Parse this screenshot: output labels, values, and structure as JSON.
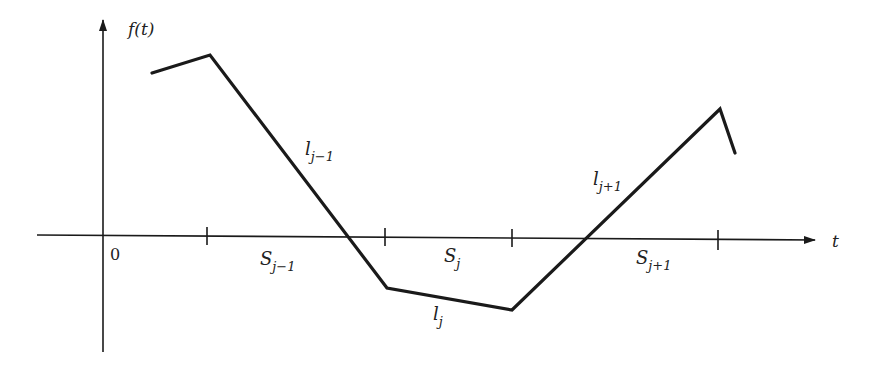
{
  "diagram": {
    "y_axis_label": "f(t)",
    "x_axis_label": "t",
    "origin_label": "0",
    "colors": {
      "ink": "#1a1a1a",
      "background": "#ffffff"
    },
    "segment_labels": [
      {
        "base": "S",
        "sub": "j−1"
      },
      {
        "base": "S",
        "sub": "j"
      },
      {
        "base": "S",
        "sub": "j+1"
      }
    ],
    "line_labels": [
      {
        "base": "l",
        "sub": "j−1"
      },
      {
        "base": "l",
        "sub": "j"
      },
      {
        "base": "l",
        "sub": "j+1"
      }
    ],
    "polyline_points": [
      [
        152,
        73
      ],
      [
        210,
        55
      ],
      [
        387,
        288
      ],
      [
        512,
        310
      ],
      [
        720,
        109
      ],
      [
        735,
        153
      ]
    ],
    "tick_positions_x": [
      207,
      385,
      512,
      718
    ]
  }
}
